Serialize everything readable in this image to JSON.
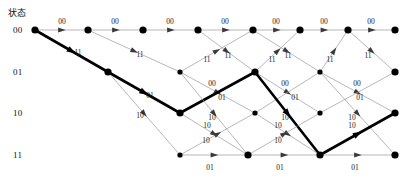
{
  "diagram": {
    "title_header": "状态",
    "type": "convolutional-code-trellis",
    "colors": {
      "edge": "#9a9a9a",
      "edge_bold": "#000000",
      "node": "#000000",
      "text": "#111111",
      "background": "#ffffff"
    },
    "state_labels": [
      "00",
      "01",
      "10",
      "11"
    ],
    "state_rows_y": [
      30,
      72,
      113,
      155
    ],
    "stage_x": [
      35,
      108,
      180,
      255,
      320,
      395
    ],
    "branch_symbols": [
      "00",
      "01",
      "10",
      "11"
    ],
    "nodes": [
      {
        "id": "n0-0",
        "state": "00",
        "x": 35,
        "y": 30,
        "big": true
      },
      {
        "id": "n1-0",
        "state": "00",
        "x": 88,
        "y": 30,
        "big": true
      },
      {
        "id": "n2-0",
        "state": "00",
        "x": 143,
        "y": 30,
        "big": true
      },
      {
        "id": "n3-0",
        "state": "00",
        "x": 198,
        "y": 30,
        "big": true
      },
      {
        "id": "n4-0",
        "state": "00",
        "x": 253,
        "y": 30,
        "big": true
      },
      {
        "id": "n5-0",
        "state": "00",
        "x": 300,
        "y": 30,
        "big": true
      },
      {
        "id": "n6-0",
        "state": "00",
        "x": 348,
        "y": 30,
        "big": true
      },
      {
        "id": "n7-0",
        "state": "00",
        "x": 395,
        "y": 30,
        "big": true
      },
      {
        "id": "n1-1",
        "state": "01",
        "x": 108,
        "y": 72,
        "big": true
      },
      {
        "id": "n2-1",
        "state": "01",
        "x": 180,
        "y": 72,
        "big": false
      },
      {
        "id": "n3-1",
        "state": "01",
        "x": 255,
        "y": 72,
        "big": true
      },
      {
        "id": "n4-1",
        "state": "01",
        "x": 320,
        "y": 72,
        "big": false
      },
      {
        "id": "n5-1",
        "state": "01",
        "x": 395,
        "y": 72,
        "big": true
      },
      {
        "id": "n2-2",
        "state": "10",
        "x": 180,
        "y": 113,
        "big": true
      },
      {
        "id": "n3-2",
        "state": "10",
        "x": 255,
        "y": 113,
        "big": false
      },
      {
        "id": "n4-2",
        "state": "10",
        "x": 320,
        "y": 113,
        "big": false
      },
      {
        "id": "n5-2",
        "state": "10",
        "x": 395,
        "y": 113,
        "big": true
      },
      {
        "id": "n3-3",
        "state": "11",
        "x": 180,
        "y": 155,
        "big": false
      },
      {
        "id": "n4-3",
        "state": "11",
        "x": 248,
        "y": 155,
        "big": true
      },
      {
        "id": "n5-3",
        "state": "11",
        "x": 320,
        "y": 155,
        "big": true
      },
      {
        "id": "n6-3",
        "state": "11",
        "x": 395,
        "y": 155,
        "big": true
      }
    ],
    "edges": [
      {
        "from": [
          35,
          30
        ],
        "to": [
          88,
          30
        ],
        "label": "00",
        "lx": 62,
        "ly": 24,
        "bold": false,
        "arrow": true
      },
      {
        "from": [
          88,
          30
        ],
        "to": [
          143,
          30
        ],
        "label": "00",
        "lx": 115,
        "ly": 24,
        "bold": false,
        "arrow": true
      },
      {
        "from": [
          143,
          30
        ],
        "to": [
          198,
          30
        ],
        "label": "00",
        "lx": 170,
        "ly": 24,
        "bold": false,
        "arrow": true
      },
      {
        "from": [
          198,
          30
        ],
        "to": [
          253,
          30
        ],
        "label": "00",
        "lx": 225,
        "ly": 24,
        "bold": false,
        "arrow": true
      },
      {
        "from": [
          253,
          30
        ],
        "to": [
          300,
          30
        ],
        "label": "00",
        "lx": 276,
        "ly": 24,
        "bold": false,
        "arrow": true
      },
      {
        "from": [
          300,
          30
        ],
        "to": [
          348,
          30
        ],
        "label": "00",
        "lx": 324,
        "ly": 24,
        "bold": false,
        "arrow": true
      },
      {
        "from": [
          348,
          30
        ],
        "to": [
          395,
          30
        ],
        "label": "00",
        "lx": 371,
        "ly": 24,
        "bold": false,
        "arrow": true
      },
      {
        "from": [
          35,
          30
        ],
        "to": [
          108,
          72
        ],
        "label": "11",
        "lx": 78,
        "ly": 55,
        "bold": true,
        "arrow": true
      },
      {
        "from": [
          88,
          30
        ],
        "to": [
          180,
          72
        ],
        "label": "11",
        "lx": 140,
        "ly": 57,
        "bold": false,
        "arrow": true
      },
      {
        "from": [
          198,
          30
        ],
        "to": [
          255,
          72
        ],
        "label": "11",
        "lx": 228,
        "ly": 58,
        "bold": false,
        "arrow": true
      },
      {
        "from": [
          253,
          30
        ],
        "to": [
          320,
          72
        ],
        "label": "11",
        "lx": 288,
        "ly": 58,
        "bold": false,
        "arrow": true
      },
      {
        "from": [
          348,
          30
        ],
        "to": [
          395,
          72
        ],
        "label": "11",
        "lx": 368,
        "ly": 58,
        "bold": false,
        "arrow": true
      },
      {
        "from": [
          180,
          72
        ],
        "to": [
          253,
          30
        ],
        "label": "11",
        "lx": 207,
        "ly": 62,
        "bold": false,
        "arrow": true
      },
      {
        "from": [
          255,
          72
        ],
        "to": [
          300,
          30
        ],
        "label": "11",
        "lx": 272,
        "ly": 62,
        "bold": false,
        "arrow": true
      },
      {
        "from": [
          320,
          72
        ],
        "to": [
          348,
          30
        ],
        "label": "11",
        "lx": 330,
        "ly": 62,
        "bold": false,
        "arrow": true
      },
      {
        "from": [
          108,
          72
        ],
        "to": [
          180,
          113
        ],
        "label": "01",
        "lx": 150,
        "ly": 98,
        "bold": true,
        "arrow": true
      },
      {
        "from": [
          180,
          72
        ],
        "to": [
          255,
          113
        ],
        "label": "01",
        "lx": 222,
        "ly": 100,
        "bold": false,
        "arrow": true
      },
      {
        "from": [
          255,
          72
        ],
        "to": [
          320,
          113
        ],
        "label": "01",
        "lx": 295,
        "ly": 100,
        "bold": false,
        "arrow": true
      },
      {
        "from": [
          320,
          72
        ],
        "to": [
          395,
          113
        ],
        "label": "01",
        "lx": 360,
        "ly": 100,
        "bold": false,
        "arrow": true
      },
      {
        "from": [
          180,
          113
        ],
        "to": [
          255,
          72
        ],
        "label": "00",
        "lx": 212,
        "ly": 86,
        "bold": true,
        "arrow": false
      },
      {
        "from": [
          255,
          113
        ],
        "to": [
          320,
          72
        ],
        "label": "00",
        "lx": 285,
        "ly": 86,
        "bold": false,
        "arrow": false
      },
      {
        "from": [
          320,
          113
        ],
        "to": [
          395,
          72
        ],
        "label": "00",
        "lx": 357,
        "ly": 86,
        "bold": false,
        "arrow": false
      },
      {
        "from": [
          108,
          72
        ],
        "to": [
          180,
          155
        ],
        "label": "10",
        "lx": 140,
        "ly": 118,
        "bold": false,
        "arrow": true
      },
      {
        "from": [
          180,
          72
        ],
        "to": [
          248,
          155
        ],
        "label": "10",
        "lx": 207,
        "ly": 128,
        "bold": false,
        "arrow": true
      },
      {
        "from": [
          255,
          72
        ],
        "to": [
          320,
          155
        ],
        "label": "10",
        "lx": 278,
        "ly": 128,
        "bold": true,
        "arrow": true
      },
      {
        "from": [
          320,
          72
        ],
        "to": [
          395,
          155
        ],
        "label": "10",
        "lx": 352,
        "ly": 128,
        "bold": false,
        "arrow": true
      },
      {
        "from": [
          180,
          113
        ],
        "to": [
          248,
          155
        ],
        "label": "10",
        "lx": 206,
        "ly": 143,
        "bold": false,
        "arrow": true
      },
      {
        "from": [
          255,
          113
        ],
        "to": [
          320,
          155
        ],
        "label": "10",
        "lx": 278,
        "ly": 143,
        "bold": false,
        "arrow": true
      },
      {
        "from": [
          180,
          155
        ],
        "to": [
          255,
          113
        ],
        "label": "10",
        "lx": 212,
        "ly": 120,
        "bold": false,
        "arrow": true
      },
      {
        "from": [
          248,
          155
        ],
        "to": [
          320,
          113
        ],
        "label": "10",
        "lx": 285,
        "ly": 120,
        "bold": false,
        "arrow": true
      },
      {
        "from": [
          320,
          155
        ],
        "to": [
          395,
          113
        ],
        "label": "10",
        "lx": 352,
        "ly": 120,
        "bold": true,
        "arrow": true
      },
      {
        "from": [
          180,
          155
        ],
        "to": [
          248,
          155
        ],
        "label": "01",
        "lx": 210,
        "ly": 170,
        "bold": false,
        "arrow": true
      },
      {
        "from": [
          248,
          155
        ],
        "to": [
          320,
          155
        ],
        "label": "01",
        "lx": 280,
        "ly": 170,
        "bold": false,
        "arrow": true
      },
      {
        "from": [
          320,
          155
        ],
        "to": [
          395,
          155
        ],
        "label": "01",
        "lx": 355,
        "ly": 170,
        "bold": false,
        "arrow": true
      }
    ],
    "survivor_path": {
      "states": [
        "00",
        "01",
        "10",
        "01",
        "11",
        "10"
      ],
      "points": [
        [
          35,
          30
        ],
        [
          108,
          72
        ],
        [
          180,
          113
        ],
        [
          255,
          72
        ],
        [
          320,
          155
        ],
        [
          395,
          113
        ]
      ],
      "branch_outputs": [
        "11",
        "01",
        "00",
        "10",
        "10"
      ]
    }
  }
}
